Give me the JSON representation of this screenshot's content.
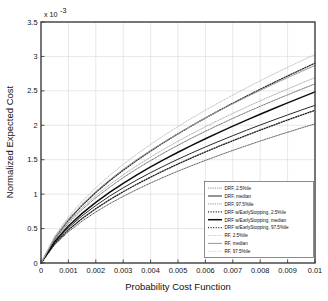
{
  "chart_data": {
    "type": "line",
    "title": "",
    "xlabel": "Probability Cost Function",
    "ylabel": "Normalized Expected Cost",
    "y_multiplier": "x 10",
    "y_multiplier_exp": "-3",
    "xlim": [
      0,
      0.01
    ],
    "ylim": [
      0,
      0.0035
    ],
    "grid": true,
    "legend_position": "lower-right",
    "xticks": [
      0,
      0.001,
      0.002,
      0.003,
      0.004,
      0.005,
      0.006,
      0.007,
      0.008,
      0.009,
      0.01
    ],
    "xticklabels": [
      "0",
      "0.001",
      "0.002",
      "0.003",
      "0.004",
      "0.005",
      "0.006",
      "0.007",
      "0.008",
      "0.009",
      "0.01"
    ],
    "yticks": [
      0,
      0.0005,
      0.001,
      0.0015,
      0.002,
      0.0025,
      0.003,
      0.0035
    ],
    "yticklabels": [
      "0",
      "0.5",
      "1",
      "1.5",
      "2",
      "2.5",
      "3",
      "3.5"
    ],
    "x": [
      0,
      0.0005,
      0.001,
      0.0015,
      0.002,
      0.0025,
      0.003,
      0.0035,
      0.004,
      0.0045,
      0.005,
      0.0055,
      0.006,
      0.0065,
      0.007,
      0.0075,
      0.008,
      0.0085,
      0.009,
      0.0095,
      0.01
    ],
    "series": [
      {
        "name": "DRF, 2.5%ile",
        "style": "dotted",
        "color": "#4a4a4a",
        "width": 0.9,
        "values": [
          0,
          0.000266,
          0.000454,
          0.000608,
          0.000741,
          0.00086,
          0.000968,
          0.001068,
          0.001162,
          0.00125,
          0.001334,
          0.001414,
          0.00149,
          0.001564,
          0.001635,
          0.001704,
          0.001771,
          0.001836,
          0.001899,
          0.001961,
          0.002021
        ]
      },
      {
        "name": "DRF, median",
        "style": "solid",
        "color": "#2b2b2b",
        "width": 1.0,
        "values": [
          0,
          0.0003,
          0.000512,
          0.000685,
          0.000835,
          0.00097,
          0.001092,
          0.001206,
          0.001312,
          0.001412,
          0.001507,
          0.001598,
          0.001685,
          0.001768,
          0.001849,
          0.001928,
          0.002004,
          0.002078,
          0.00215,
          0.002221,
          0.00229
        ]
      },
      {
        "name": "DRF, 97.5%ile",
        "style": "dotted",
        "color": "#5a5a5a",
        "width": 0.9,
        "values": [
          0,
          0.00034,
          0.00058,
          0.000777,
          0.000947,
          0.0011,
          0.001239,
          0.001368,
          0.001488,
          0.001602,
          0.00171,
          0.001814,
          0.001913,
          0.002008,
          0.0021,
          0.002189,
          0.002276,
          0.00236,
          0.002442,
          0.002523,
          0.002601
        ]
      },
      {
        "name": "DRF w/EarlyStopping, 2.5%ile",
        "style": "dotted-bold",
        "color": "#202020",
        "width": 1.35,
        "values": [
          0,
          0.00028,
          0.000481,
          0.000646,
          0.000789,
          0.000918,
          0.001035,
          0.001145,
          0.001247,
          0.001345,
          0.001438,
          0.001527,
          0.001613,
          0.001696,
          0.001776,
          0.001854,
          0.00193,
          0.002004,
          0.002077,
          0.002148,
          0.002217
        ]
      },
      {
        "name": "DRF w/EarlyStopping, median",
        "style": "solid-bold",
        "color": "#0d0d0d",
        "width": 1.5,
        "values": [
          0,
          0.000312,
          0.000537,
          0.000721,
          0.000881,
          0.001025,
          0.001157,
          0.00128,
          0.001395,
          0.001504,
          0.001608,
          0.001708,
          0.001804,
          0.001897,
          0.001987,
          0.002075,
          0.002161,
          0.002244,
          0.002326,
          0.002406,
          0.002485
        ]
      },
      {
        "name": "DRF w/EarlyStopping, 97.5%ile",
        "style": "dotted-bold",
        "color": "#303030",
        "width": 1.35,
        "values": [
          0,
          0.00036,
          0.000622,
          0.000838,
          0.001025,
          0.001193,
          0.001347,
          0.001491,
          0.001626,
          0.001754,
          0.001876,
          0.001993,
          0.002106,
          0.002215,
          0.00232,
          0.002423,
          0.002523,
          0.002621,
          0.002716,
          0.00281,
          0.002902
        ]
      },
      {
        "name": "RF, 2.5%ile",
        "style": "dotted",
        "color": "#a8a8a8",
        "width": 0.9,
        "values": [
          0,
          0.000352,
          0.0006,
          0.000803,
          0.000979,
          0.001136,
          0.00128,
          0.001413,
          0.001538,
          0.001656,
          0.001768,
          0.001875,
          0.001978,
          0.002077,
          0.002172,
          0.002265,
          0.002355,
          0.002442,
          0.002527,
          0.002611,
          0.002692
        ]
      },
      {
        "name": "RF, median",
        "style": "solid",
        "color": "#9a9a9a",
        "width": 1.0,
        "values": [
          0,
          0.000372,
          0.000636,
          0.000852,
          0.001039,
          0.001207,
          0.00136,
          0.001502,
          0.001635,
          0.001761,
          0.00188,
          0.001995,
          0.002104,
          0.00221,
          0.002312,
          0.002411,
          0.002507,
          0.002601,
          0.002692,
          0.002781,
          0.002868
        ]
      },
      {
        "name": "RF, 97.5%ile",
        "style": "dotted",
        "color": "#bdbdbd",
        "width": 0.9,
        "values": [
          0,
          0.00039,
          0.000668,
          0.000896,
          0.001093,
          0.00127,
          0.001432,
          0.001582,
          0.001722,
          0.001855,
          0.001982,
          0.002103,
          0.002219,
          0.002331,
          0.002439,
          0.002544,
          0.002646,
          0.002745,
          0.002842,
          0.002936,
          0.003028
        ]
      }
    ]
  }
}
